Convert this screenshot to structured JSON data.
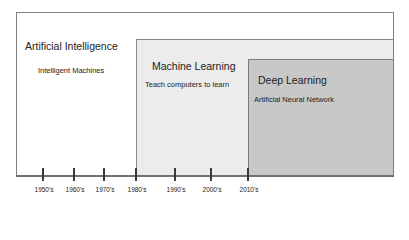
{
  "diagram": {
    "boxes": [
      {
        "id": "ai",
        "title": "Artificial Intelligence",
        "subtitle": "Intelligent Machines",
        "fill": "#ffffff",
        "start_era": "1950's"
      },
      {
        "id": "ml",
        "title": "Machine Learning",
        "subtitle": "Teach computers to learn",
        "fill": "#ececec",
        "start_era": "1980's"
      },
      {
        "id": "dl",
        "title": "Deep Learning",
        "subtitle": "Artificial Neural Network",
        "fill": "#c8c8c8",
        "start_era": "2010's"
      }
    ],
    "timeline": {
      "ticks": [
        "1950's",
        "1960's",
        "1970's",
        "1980's",
        "1990's",
        "2000's",
        "2010's"
      ]
    },
    "border_color": "#808080"
  }
}
